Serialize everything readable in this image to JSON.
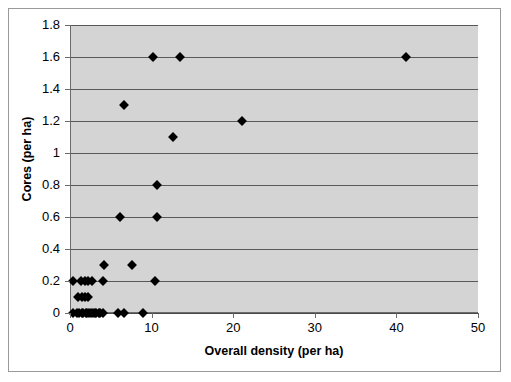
{
  "chart_data": {
    "type": "scatter",
    "title": "",
    "xlabel": "Overall density (per ha)",
    "ylabel": "Cores (per ha)",
    "xlim": [
      0,
      50
    ],
    "ylim": [
      0,
      1.8
    ],
    "xticks": [
      "0",
      "10",
      "20",
      "30",
      "40",
      "50"
    ],
    "xtick_values": [
      0,
      10,
      20,
      30,
      40,
      50
    ],
    "yticks": [
      "0",
      "0.2",
      "0.4",
      "0.6",
      "0.8",
      "1",
      "1.2",
      "1.4",
      "1.6",
      "1.8"
    ],
    "ytick_values": [
      0,
      0.2,
      0.4,
      0.6,
      0.8,
      1.0,
      1.2,
      1.4,
      1.6,
      1.8
    ],
    "grid": "horizontal",
    "legend": "none",
    "marker": "diamond",
    "marker_color": "#000000",
    "plot_background": "#d4d4d4",
    "figure_background": "#ffffff",
    "points": [
      {
        "x": 0.3,
        "y": 0.0
      },
      {
        "x": 0.7,
        "y": 0.0
      },
      {
        "x": 1.0,
        "y": 0.0
      },
      {
        "x": 1.3,
        "y": 0.0
      },
      {
        "x": 1.5,
        "y": 0.0
      },
      {
        "x": 1.8,
        "y": 0.0
      },
      {
        "x": 2.0,
        "y": 0.0
      },
      {
        "x": 2.2,
        "y": 0.0
      },
      {
        "x": 2.5,
        "y": 0.0
      },
      {
        "x": 2.7,
        "y": 0.0
      },
      {
        "x": 2.9,
        "y": 0.0
      },
      {
        "x": 3.1,
        "y": 0.0
      },
      {
        "x": 3.4,
        "y": 0.0
      },
      {
        "x": 3.6,
        "y": 0.0
      },
      {
        "x": 3.9,
        "y": 0.0
      },
      {
        "x": 5.8,
        "y": 0.0
      },
      {
        "x": 6.5,
        "y": 0.0
      },
      {
        "x": 8.8,
        "y": 0.0
      },
      {
        "x": 0.9,
        "y": 0.1
      },
      {
        "x": 1.3,
        "y": 0.1
      },
      {
        "x": 1.7,
        "y": 0.1
      },
      {
        "x": 2.1,
        "y": 0.1
      },
      {
        "x": 0.3,
        "y": 0.2
      },
      {
        "x": 1.2,
        "y": 0.2
      },
      {
        "x": 1.7,
        "y": 0.2
      },
      {
        "x": 2.1,
        "y": 0.2
      },
      {
        "x": 2.6,
        "y": 0.2
      },
      {
        "x": 3.9,
        "y": 0.2
      },
      {
        "x": 10.3,
        "y": 0.2
      },
      {
        "x": 4.0,
        "y": 0.3
      },
      {
        "x": 7.5,
        "y": 0.3
      },
      {
        "x": 6.0,
        "y": 0.6
      },
      {
        "x": 10.5,
        "y": 0.6
      },
      {
        "x": 10.5,
        "y": 0.8
      },
      {
        "x": 12.5,
        "y": 1.1
      },
      {
        "x": 21.0,
        "y": 1.2
      },
      {
        "x": 6.5,
        "y": 1.3
      },
      {
        "x": 10.0,
        "y": 1.6
      },
      {
        "x": 13.3,
        "y": 1.6
      },
      {
        "x": 41.0,
        "y": 1.6
      }
    ]
  }
}
